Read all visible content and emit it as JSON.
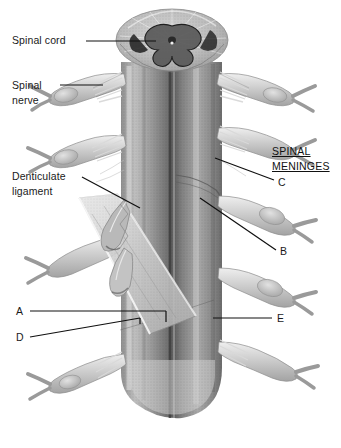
{
  "figure": {
    "style": "grayscale anatomical halftone illustration",
    "background_color": "#ffffff",
    "ink_color": "#1a1a1a"
  },
  "labels": {
    "spinal_cord": "Spinal cord",
    "spinal_nerve_line1": "Spinal",
    "spinal_nerve_line2": "nerve",
    "denticulate_line1": "Denticulate",
    "denticulate_line2": "ligament",
    "meninges_line1": "SPINAL",
    "meninges_line2": "MENINGES"
  },
  "markers": {
    "a": "A",
    "b": "B",
    "c": "C",
    "d": "D",
    "e": "E"
  },
  "anatomy": {
    "cross_section": "spinal cord transverse section with butterfly gray matter",
    "central_column": "spinal cord longitudinal column",
    "rootlets": "spinal nerve rootlets",
    "ganglia": "dorsal root ganglia",
    "dura_flap": "reflected dura mater sheet",
    "denticulate": "denticulate ligament",
    "conus": "spinal cord inferior continuation"
  }
}
